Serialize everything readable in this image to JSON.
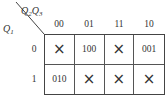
{
  "column_variable": {
    "main": "Q",
    "sub1": "2",
    "main2": "Q",
    "sub2": "3"
  },
  "row_variable": {
    "main": "Q",
    "sub": "1"
  },
  "column_headers": [
    "00",
    "01",
    "11",
    "10"
  ],
  "row_headers": [
    "0",
    "1"
  ],
  "dont_care_symbol": "×",
  "cells": [
    [
      "×",
      "100",
      "×",
      "001"
    ],
    [
      "010",
      "×",
      "×",
      "×"
    ]
  ]
}
